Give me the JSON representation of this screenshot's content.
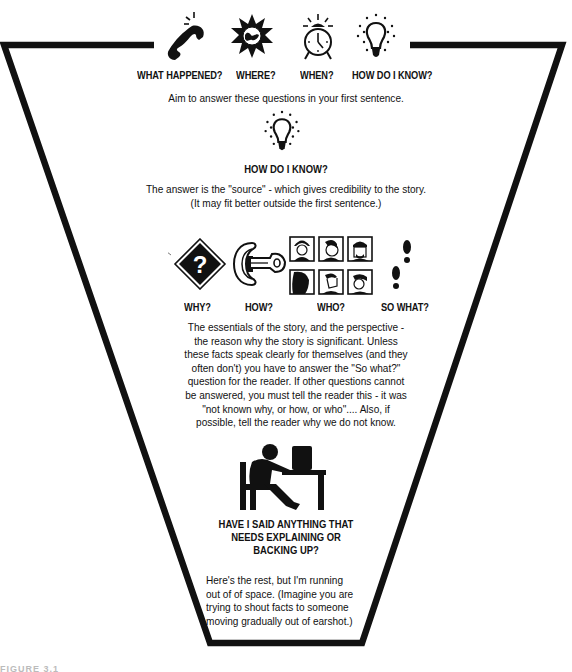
{
  "diagram": {
    "type": "inverted-pyramid",
    "colors": {
      "ink": "#111111",
      "paper": "#ffffff"
    }
  },
  "top_section": {
    "icons": [
      {
        "name": "telephone-icon",
        "label": "WHAT HAPPENED?"
      },
      {
        "name": "globe-star-icon",
        "label": "WHERE?"
      },
      {
        "name": "alarm-clock-icon",
        "label": "WHEN?"
      },
      {
        "name": "lightbulb-icon",
        "label": "HOW DO I KNOW?"
      }
    ],
    "caption": "Aim to answer these questions in your first sentence."
  },
  "source_section": {
    "icon": "lightbulb-icon",
    "heading": "HOW DO I KNOW?",
    "lines": [
      "The answer is the \"source\" - which gives credibility to the story.",
      "(It may fit better outside the first sentence.)"
    ]
  },
  "essentials_section": {
    "icons": [
      {
        "name": "question-diamond-icon",
        "label": "WHY?"
      },
      {
        "name": "key-lock-icon",
        "label": "HOW?"
      },
      {
        "name": "faces-grid-icon",
        "label": "WHO?"
      },
      {
        "name": "footprints-icon",
        "label": "SO WHAT?"
      }
    ],
    "lines": [
      "The essentials of the story, and the perspective -",
      "the reason why the story is significant. Unless",
      "these facts speak clearly for themselves (and they",
      "often don't) you have to answer the \"So what?\"",
      "question for the reader. If other questions cannot",
      "be answered, you must tell the reader this - it was",
      "\"not known why, or how, or who\".... Also, if",
      "possible, tell the reader why we do not know."
    ]
  },
  "backup_section": {
    "icon": "person-at-computer-icon",
    "heading_lines": [
      "HAVE I SAID ANYTHING THAT",
      "NEEDS EXPLAINING OR",
      "BACKING UP?"
    ]
  },
  "rest_section": {
    "lines": [
      "Here's the rest, but I'm running",
      "out of of space. (Imagine you are",
      "trying to shout facts to someone",
      "moving gradually out of earshot.)"
    ]
  },
  "footer_fragment": "FIGURE 3.1"
}
